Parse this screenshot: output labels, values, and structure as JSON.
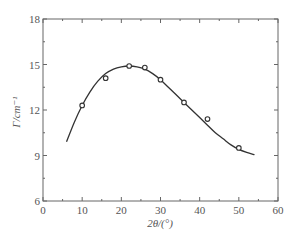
{
  "chart_data": {
    "type": "scatter",
    "title": "",
    "xlabel": "2θ/(°)",
    "ylabel": "Γ/cm⁻¹",
    "xlim": [
      0,
      60
    ],
    "ylim": [
      6,
      18
    ],
    "x_ticks": [
      0,
      10,
      20,
      30,
      40,
      50,
      60
    ],
    "y_ticks": [
      6,
      9,
      12,
      15,
      18
    ],
    "grid": false,
    "legend": null,
    "series": [
      {
        "name": "measured",
        "style": "open-circle markers",
        "x": [
          10,
          16,
          22,
          26,
          30,
          36,
          42,
          50
        ],
        "y": [
          12.3,
          14.1,
          14.9,
          14.8,
          14.0,
          12.5,
          11.4,
          9.5
        ]
      },
      {
        "name": "fit",
        "style": "solid line",
        "x": [
          6,
          8,
          10,
          12,
          14,
          16,
          18,
          20,
          22,
          24,
          26,
          28,
          30,
          32,
          34,
          36,
          38,
          40,
          42,
          44,
          46,
          48,
          50,
          52,
          54
        ],
        "y": [
          9.9,
          11.2,
          12.3,
          13.2,
          13.9,
          14.4,
          14.7,
          14.85,
          14.9,
          14.85,
          14.7,
          14.4,
          14.0,
          13.5,
          13.0,
          12.5,
          12.0,
          11.5,
          11.0,
          10.5,
          10.1,
          9.7,
          9.4,
          9.2,
          9.05
        ]
      }
    ]
  },
  "colors": {
    "axis": "#666666",
    "line": "#333333",
    "marker": "#333333"
  }
}
